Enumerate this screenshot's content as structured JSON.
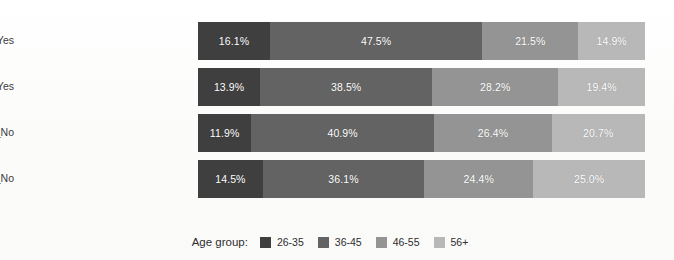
{
  "chart_data": {
    "type": "bar",
    "subtype": "stacked-horizontal-100pct",
    "title": "",
    "xlabel": "",
    "ylabel": "",
    "xlim": [
      0,
      100
    ],
    "grid": false,
    "legend_position": "bottom-center",
    "legend_title": "Age group:",
    "categories": [
      "A: VR_Yes Remote_Yes",
      "B: VR_No Remote_Yes",
      "C: VR_Yes Remote_No",
      "D: VR_No Remote_No"
    ],
    "series": [
      {
        "name": "26-35",
        "color": "#3f3f3f",
        "values": [
          16.1,
          13.9,
          11.9,
          14.5
        ]
      },
      {
        "name": "36-45",
        "color": "#636363",
        "values": [
          47.5,
          38.5,
          40.9,
          36.1
        ]
      },
      {
        "name": "46-55",
        "color": "#949494",
        "values": [
          21.5,
          28.2,
          26.4,
          24.4
        ]
      },
      {
        "name": "56+",
        "color": "#b8b8b8",
        "values": [
          14.9,
          19.4,
          20.7,
          25.0
        ]
      }
    ],
    "data_labels": [
      [
        "16.1%",
        "47.5%",
        "21.5%",
        "14.9%"
      ],
      [
        "13.9%",
        "38.5%",
        "28.2%",
        "19.4%"
      ],
      [
        "11.9%",
        "40.9%",
        "26.4%",
        "20.7%"
      ],
      [
        "14.5%",
        "36.1%",
        "24.4%",
        "25.0%"
      ]
    ],
    "label_color": "#ffffff",
    "background_color": "#fdfdfd"
  }
}
